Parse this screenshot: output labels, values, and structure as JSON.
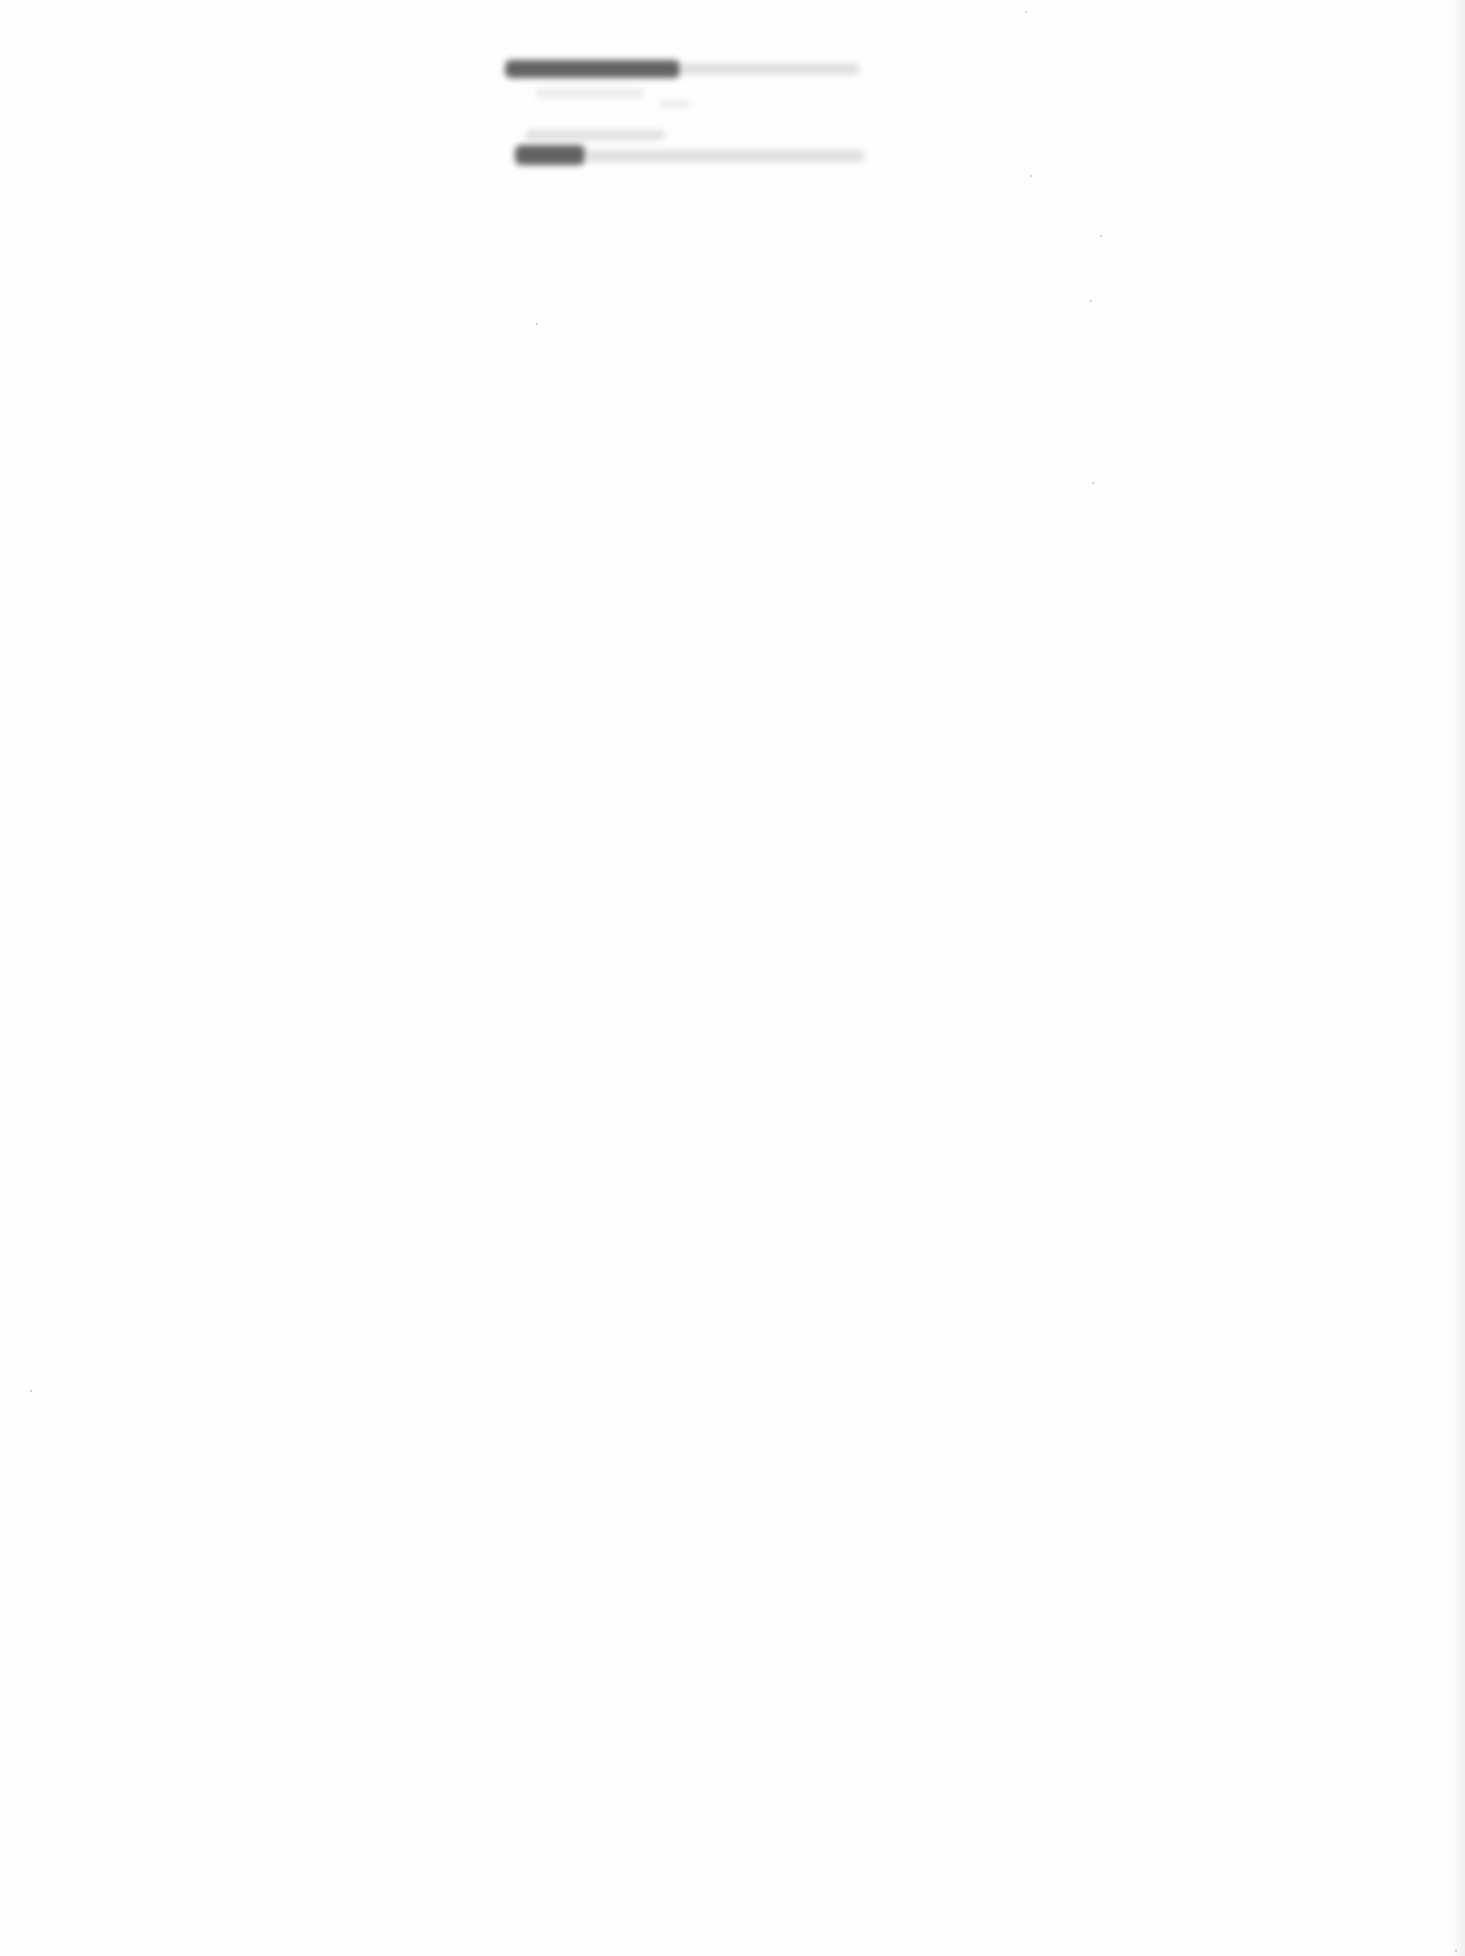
{
  "document": {
    "type": "scanned-page",
    "background_color": "#fefefe",
    "legible_text": [],
    "illegible_text_regions": [
      {
        "label": "line-1",
        "x": 505,
        "y": 60,
        "w": 175,
        "h": 18,
        "tone": "dark"
      },
      {
        "label": "line-1-tail",
        "x": 680,
        "y": 63,
        "w": 180,
        "h": 12,
        "tone": "light"
      },
      {
        "label": "line-2",
        "x": 535,
        "y": 88,
        "w": 110,
        "h": 10,
        "tone": "faint"
      },
      {
        "label": "line-3",
        "x": 525,
        "y": 130,
        "w": 140,
        "h": 10,
        "tone": "light"
      },
      {
        "label": "line-4",
        "x": 515,
        "y": 145,
        "w": 70,
        "h": 20,
        "tone": "dark"
      },
      {
        "label": "line-4-tail",
        "x": 585,
        "y": 150,
        "w": 280,
        "h": 12,
        "tone": "light"
      }
    ]
  }
}
